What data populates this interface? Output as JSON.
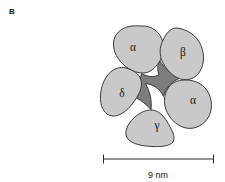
{
  "figure": {
    "panel_letter": "B",
    "caption_absent": true
  },
  "diagram": {
    "type": "nicotinic-acetylcholine-receptor-pentamer-top-view",
    "fill_subunit": "#c9c9c9",
    "fill_pore": "#7d7d7d",
    "stroke": "#3a3a3a",
    "background": "#ffffff",
    "subunits": [
      {
        "id": "alpha-top-left",
        "label": "α",
        "label_x": 133,
        "label_y": 48
      },
      {
        "id": "beta-top-right",
        "label": "β",
        "label_x": 183,
        "label_y": 53
      },
      {
        "id": "alpha-right",
        "label": "α",
        "label_x": 193,
        "label_y": 101
      },
      {
        "id": "gamma-bottom",
        "label": "γ",
        "label_x": 157,
        "label_y": 126
      },
      {
        "id": "delta-left",
        "label": "δ",
        "label_x": 122,
        "label_y": 94
      }
    ]
  },
  "scalebar": {
    "label": "9 nm",
    "left_x": 103,
    "right_x": 214,
    "y": 159,
    "label_x": 158,
    "label_y": 176
  }
}
